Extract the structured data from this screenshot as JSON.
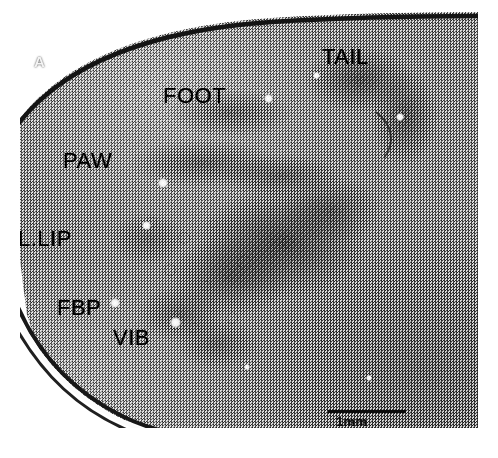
{
  "figure": {
    "panel_letter": "A",
    "caption_alt": "Grayscale histological micrograph of rodent somatosensory cortex showing the barrel field with somatotopic body-part labels."
  },
  "annotations": [
    {
      "id": "tail",
      "label": "TAIL",
      "x": 322,
      "y": 46,
      "font_size": 22,
      "color": "#000000"
    },
    {
      "id": "foot",
      "label": "FOOT",
      "x": 163,
      "y": 85,
      "font_size": 22,
      "color": "#000000"
    },
    {
      "id": "paw",
      "label": "PAW",
      "x": 63,
      "y": 150,
      "font_size": 22,
      "color": "#000000"
    },
    {
      "id": "l-lip",
      "label": "L.LIP",
      "x": 18,
      "y": 228,
      "font_size": 22,
      "color": "#000000"
    },
    {
      "id": "fbp",
      "label": "FBP",
      "x": 57,
      "y": 297,
      "font_size": 22,
      "color": "#000000"
    },
    {
      "id": "vib",
      "label": "VIB",
      "x": 113,
      "y": 327,
      "font_size": 22,
      "color": "#000000"
    }
  ],
  "scale_bar": {
    "label": "1mm",
    "length_px": 78,
    "value": 1,
    "unit": "mm"
  },
  "puncta": [
    {
      "x": 268,
      "y": 98,
      "d": 9
    },
    {
      "x": 163,
      "y": 183,
      "d": 10
    },
    {
      "x": 146,
      "y": 225,
      "d": 9
    },
    {
      "x": 115,
      "y": 303,
      "d": 10
    },
    {
      "x": 175,
      "y": 322,
      "d": 11
    },
    {
      "x": 400,
      "y": 117,
      "d": 8
    },
    {
      "x": 316,
      "y": 75,
      "d": 7
    },
    {
      "x": 247,
      "y": 367,
      "d": 6
    },
    {
      "x": 369,
      "y": 378,
      "d": 6
    }
  ],
  "palette": {
    "background": "#ffffff",
    "tissue_mid": "#8d8d8d",
    "tissue_dark": "#2b2b2b",
    "ink": "#000000",
    "glass_white": "#fbfbfb"
  }
}
